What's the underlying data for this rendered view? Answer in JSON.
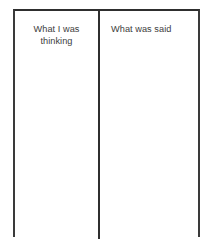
{
  "document": {
    "type": "two-column-worksheet",
    "title": "",
    "page_background": "#ffffff",
    "border_color": "#2e2e2e",
    "divider_color": "#2f2f2f",
    "text_color": "#3c3c3c",
    "bottom_border_visible": false
  },
  "table": {
    "columns": [
      {
        "id": "thinking",
        "header": "What I was\nthinking",
        "header_lines": [
          "What I was",
          "thinking"
        ],
        "header_align": "center",
        "cells": [],
        "cell_text": ""
      },
      {
        "id": "said",
        "header": "What was said",
        "header_lines": [
          "What was said"
        ],
        "header_align": "left",
        "cells": [],
        "cell_text": ""
      }
    ]
  }
}
